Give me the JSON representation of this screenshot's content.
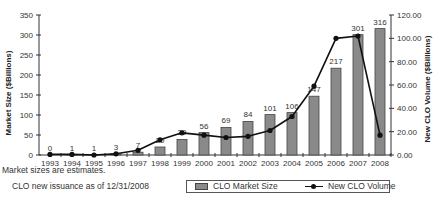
{
  "chart_data": {
    "type": "bar",
    "combo": "bar+line",
    "title": "",
    "categories": [
      "1993",
      "1994",
      "1995",
      "1996",
      "1997",
      "1998",
      "1999",
      "2000",
      "2001",
      "2002",
      "2003",
      "2004",
      "2005",
      "2006",
      "2007",
      "2008"
    ],
    "series": [
      {
        "name": "CLO Market Size",
        "type": "bar",
        "axis": "left",
        "color": "#8a8a8a",
        "values": [
          0,
          1,
          1,
          3,
          7,
          20,
          39,
          56,
          69,
          84,
          101,
          106,
          147,
          217,
          301,
          316
        ],
        "labels": [
          "0",
          "1",
          "1",
          "3",
          "7",
          "20",
          "39",
          "56",
          "69",
          "84",
          "101",
          "106",
          "147",
          "217",
          "301",
          "316"
        ]
      },
      {
        "name": "New CLO Volume",
        "type": "line",
        "axis": "right",
        "color": "#111111",
        "values": [
          0.5,
          0.5,
          0,
          1,
          4,
          13,
          19,
          17,
          15,
          16,
          21,
          33,
          59,
          100,
          102,
          17
        ]
      }
    ],
    "left_axis": {
      "label": "Market Size ($Billions)",
      "ylim": [
        0,
        350
      ],
      "ticks": [
        "0",
        "50",
        "100",
        "150",
        "200",
        "250",
        "300",
        "350"
      ]
    },
    "right_axis": {
      "label": "New CLO Volume ($Billions)",
      "ylim": [
        0,
        120
      ],
      "ticks": [
        "0.00",
        "20.00",
        "40.00",
        "60.00",
        "80.00",
        "100.00",
        "120.00"
      ]
    },
    "xlabel": "",
    "grid": false,
    "legend_position": "bottom-right"
  },
  "notes": {
    "line1": "Market sizes are estimates.",
    "line2": "CLO new issuance as of 12/31/2008"
  },
  "legend": {
    "bar_label": "CLO Market Size",
    "line_label": "New CLO Volume"
  }
}
